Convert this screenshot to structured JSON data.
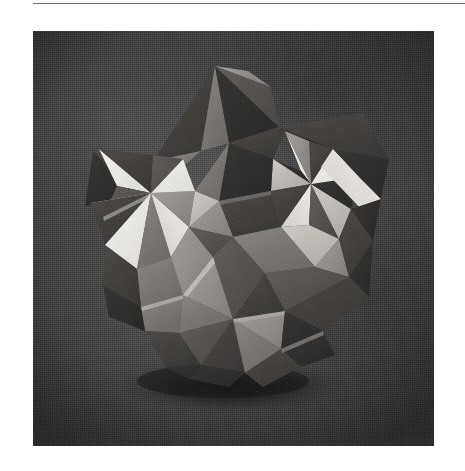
{
  "page": {
    "background_color": "#ffffff",
    "width": 465,
    "height": 471,
    "caption": ""
  },
  "rule": {
    "name": "top-horizontal-rule",
    "color": "#6e6e6e",
    "x": 33,
    "y": 3,
    "width": 432,
    "height": 1
  },
  "figure": {
    "kind": "photograph",
    "frame": {
      "x": 33,
      "y": 31,
      "width": 401,
      "height": 415
    },
    "background": {
      "name": "dark-cloth-backdrop",
      "base_color": "#3c3c3c",
      "vignette_color": "#1a1a1a",
      "texture": "woven-fabric"
    },
    "object": {
      "name": "polyhedron-model",
      "silhouette_center": {
        "x": 230,
        "y": 220
      },
      "apex": {
        "x": 215,
        "y": 66
      },
      "left_extent_x": 86,
      "right_extent_x": 374,
      "bottom_extent_y": 385,
      "shadow": {
        "name": "cast-shadow",
        "color": "#141414",
        "center": {
          "x": 232,
          "y": 386
        },
        "rx": 116,
        "ry": 26
      },
      "pinwheel_centers": [
        {
          "name": "pinwheel-left",
          "x": 150,
          "y": 193
        },
        {
          "name": "pinwheel-upper",
          "x": 311,
          "y": 184
        },
        {
          "name": "pinwheel-lower",
          "x": 232,
          "y": 338
        }
      ],
      "facet_palette": {
        "highlight_white": "#f2f0ec",
        "bright_white": "#e8e6e1",
        "light_gray": "#c9c6c1",
        "mid_gray": "#9a9792",
        "medium_gray": "#7d7a76",
        "dark_gray": "#5a5754",
        "deep_gray": "#433f3d",
        "shadow_gray": "#2e2b29"
      }
    }
  }
}
